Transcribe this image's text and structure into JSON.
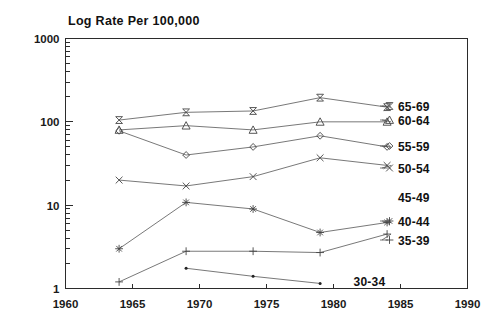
{
  "chart_data": {
    "type": "line",
    "title": "Log Rate Per 100,000",
    "xlabel": "",
    "ylabel": "Log Rate Per 100,000",
    "yscale": "log",
    "ylim": [
      1,
      1000
    ],
    "xlim": [
      1960,
      1990
    ],
    "grid": false,
    "legend_position": "right-inline",
    "y_ticks": [
      "1",
      "10",
      "100",
      "1000"
    ],
    "y_tick_values": [
      1,
      10,
      100,
      1000
    ],
    "x_ticks": [
      "1960",
      "1965",
      "1970",
      "1975",
      "1980",
      "1985",
      "1990"
    ],
    "x_tick_values": [
      1960,
      1965,
      1970,
      1975,
      1980,
      1985,
      1990
    ],
    "x": [
      1964,
      1969,
      1974,
      1979,
      1984
    ],
    "series": [
      {
        "name": "65-69",
        "marker": "bowtie",
        "x": [
          1964,
          1969,
          1974,
          1979,
          1984
        ],
        "values": [
          105,
          130,
          135,
          195,
          150
        ]
      },
      {
        "name": "60-64",
        "marker": "triangle",
        "x": [
          1964,
          1969,
          1974,
          1979,
          1984
        ],
        "values": [
          80,
          90,
          80,
          100,
          100
        ]
      },
      {
        "name": "55-59",
        "marker": "diamond",
        "x": [
          1964,
          1969,
          1974,
          1979,
          1984
        ],
        "values": [
          78,
          40,
          50,
          68,
          50
        ]
      },
      {
        "name": "50-54",
        "marker": "x-cross",
        "x": [
          1964,
          1969,
          1974,
          1979,
          1984
        ],
        "values": [
          20,
          17,
          22,
          37,
          30
        ]
      },
      {
        "name": "45-49",
        "marker": "none",
        "x": [],
        "values": []
      },
      {
        "name": "40-44",
        "marker": "asterisk",
        "x": [
          1964,
          1969,
          1974,
          1979,
          1984
        ],
        "values": [
          3.0,
          10.8,
          9.0,
          4.7,
          6.2
        ]
      },
      {
        "name": "35-39",
        "marker": "plus",
        "x": [
          1964,
          1969,
          1974,
          1979,
          1984
        ],
        "values": [
          1.2,
          2.8,
          2.8,
          2.7,
          4.5
        ]
      },
      {
        "name": "30-34",
        "marker": "dot",
        "x": [
          1969,
          1974,
          1979
        ],
        "values": [
          1.75,
          1.4,
          1.15
        ]
      }
    ],
    "annotations": [
      {
        "text": "30-34",
        "x": 1981.5,
        "y": 1.2
      }
    ],
    "legend_entries": [
      {
        "label": "65-69",
        "marker": "bowtie"
      },
      {
        "label": "60-64",
        "marker": "triangle"
      },
      {
        "label": "55-59",
        "marker": "diamond"
      },
      {
        "label": "50-54",
        "marker": "x-cross"
      },
      {
        "label": "45-49",
        "marker": "none"
      },
      {
        "label": "40-44",
        "marker": "asterisk"
      },
      {
        "label": "35-39",
        "marker": "plus"
      }
    ],
    "colors": {
      "axis": "#2b2b2b",
      "line": "#555555",
      "marker": "#444444",
      "text": "#111111",
      "background": "#ffffff"
    }
  }
}
